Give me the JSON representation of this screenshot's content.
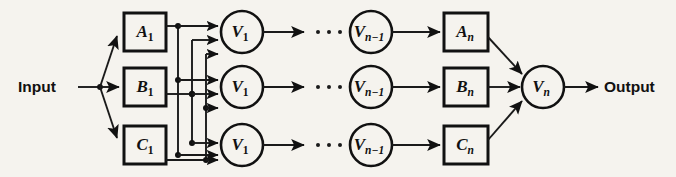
{
  "figure": {
    "type": "block-diagram",
    "background_color": "#f5f3ee",
    "line_color": "#111111"
  },
  "io": {
    "input_label": "Input",
    "output_label": "Output"
  },
  "ellipsis": {
    "glyph": "...",
    "count": 3
  },
  "stage1": {
    "modules": [
      {
        "id": "A1",
        "base": "A",
        "sub": "1",
        "row": "top"
      },
      {
        "id": "B1",
        "base": "B",
        "sub": "1",
        "row": "middle"
      },
      {
        "id": "C1",
        "base": "C",
        "sub": "1",
        "row": "bottom"
      }
    ],
    "voters": [
      {
        "id": "V1-top",
        "base": "V",
        "sub": "1",
        "row": "top"
      },
      {
        "id": "V1-mid",
        "base": "V",
        "sub": "1",
        "row": "middle"
      },
      {
        "id": "V1-bot",
        "base": "V",
        "sub": "1",
        "row": "bottom"
      }
    ]
  },
  "stageN": {
    "voters_prev": [
      {
        "id": "Vn-1-top",
        "base": "V",
        "sub": "n−1",
        "row": "top"
      },
      {
        "id": "Vn-1-mid",
        "base": "V",
        "sub": "n−1",
        "row": "middle"
      },
      {
        "id": "Vn-1-bot",
        "base": "V",
        "sub": "n−1",
        "row": "bottom"
      }
    ],
    "modules": [
      {
        "id": "An",
        "base": "A",
        "sub": "n",
        "row": "top"
      },
      {
        "id": "Bn",
        "base": "B",
        "sub": "n",
        "row": "middle"
      },
      {
        "id": "Cn",
        "base": "C",
        "sub": "n",
        "row": "bottom"
      }
    ],
    "final_voter": {
      "id": "Vn",
      "base": "V",
      "sub": "n"
    }
  }
}
